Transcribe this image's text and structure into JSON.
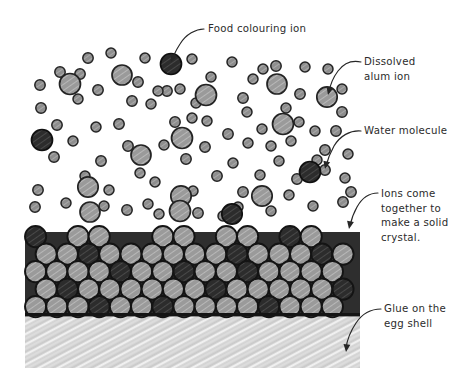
{
  "diagram": {
    "background_color": "#ffffff",
    "width": 474,
    "height": 377
  },
  "labels": [
    {
      "id": "food-colouring-ion",
      "lines": [
        "Food colouring ion"
      ],
      "text_x": 208,
      "text_y": 32,
      "anchor": "start"
    },
    {
      "id": "dissolved-alum-ion",
      "lines": [
        "Dissolved",
        "alum ion"
      ],
      "text_x": 364,
      "text_y": 65,
      "anchor": "start"
    },
    {
      "id": "water-molecule",
      "lines": [
        "Water molecule"
      ],
      "text_x": 364,
      "text_y": 134,
      "anchor": "start"
    },
    {
      "id": "ions-come-together",
      "lines": [
        "Ions come",
        "together to",
        "make a solid",
        "crystal."
      ],
      "text_x": 381,
      "text_y": 197,
      "anchor": "start"
    },
    {
      "id": "glue-on-egg-shell",
      "lines": [
        "Glue on the",
        "egg shell"
      ],
      "text_x": 384,
      "text_y": 312,
      "anchor": "start"
    }
  ],
  "leaders": [
    {
      "id": "leader-food-colouring-ion",
      "path": "M 204 29 C 196 29, 186 34, 180 44 C 176 50, 174 55, 172 59",
      "arrow": {
        "x": 171,
        "y": 62,
        "angle": 112
      }
    },
    {
      "id": "leader-dissolved-alum-ion",
      "path": "M 361 62 C 352 60, 344 63, 338 71 C 332 79, 330 86, 329 92",
      "arrow": {
        "x": 328,
        "y": 95,
        "angle": 104
      }
    },
    {
      "id": "leader-water-molecule",
      "path": "M 361 131 C 350 130, 340 136, 334 146 C 329 155, 327 162, 326 166",
      "arrow": {
        "x": 325,
        "y": 169,
        "angle": 103
      }
    },
    {
      "id": "leader-ions-come-together",
      "path": "M 378 193 C 370 193, 362 198, 357 207 C 353 214, 351 221, 350 226",
      "arrow": {
        "x": 349,
        "y": 229,
        "angle": 101
      }
    },
    {
      "id": "leader-glue-on-egg-shell",
      "path": "M 381 309 C 371 309, 362 314, 356 323 C 350 332, 347 341, 346 348",
      "arrow": {
        "x": 346,
        "y": 352,
        "angle": 97
      }
    }
  ],
  "solution": {
    "region": {
      "x": 20,
      "y": 35,
      "width": 340,
      "height": 190
    },
    "water_molecules": [
      {
        "x": 88,
        "y": 58,
        "r": 5.2
      },
      {
        "x": 111,
        "y": 53,
        "r": 5.0
      },
      {
        "x": 145,
        "y": 58,
        "r": 5.0
      },
      {
        "x": 192,
        "y": 59,
        "r": 5.0
      },
      {
        "x": 232,
        "y": 62,
        "r": 5.0
      },
      {
        "x": 276,
        "y": 66,
        "r": 5.2
      },
      {
        "x": 305,
        "y": 67,
        "r": 5.0
      },
      {
        "x": 328,
        "y": 69,
        "r": 5.0
      },
      {
        "x": 60,
        "y": 72,
        "r": 5.2
      },
      {
        "x": 80,
        "y": 74,
        "r": 5.2
      },
      {
        "x": 138,
        "y": 82,
        "r": 5.2
      },
      {
        "x": 211,
        "y": 77,
        "r": 5.0
      },
      {
        "x": 253,
        "y": 79,
        "r": 5.0
      },
      {
        "x": 300,
        "y": 94,
        "r": 5.2
      },
      {
        "x": 40,
        "y": 85,
        "r": 5.2
      },
      {
        "x": 98,
        "y": 90,
        "r": 5.2
      },
      {
        "x": 167,
        "y": 91,
        "r": 5.2
      },
      {
        "x": 180,
        "y": 89,
        "r": 5.0
      },
      {
        "x": 158,
        "y": 91,
        "r": 5.0
      },
      {
        "x": 243,
        "y": 98,
        "r": 5.2
      },
      {
        "x": 342,
        "y": 89,
        "r": 5.0
      },
      {
        "x": 263,
        "y": 69,
        "r": 5.0
      },
      {
        "x": 78,
        "y": 99,
        "r": 5.0
      },
      {
        "x": 41,
        "y": 108,
        "r": 5.2
      },
      {
        "x": 132,
        "y": 101,
        "r": 5.2
      },
      {
        "x": 151,
        "y": 104,
        "r": 5.0
      },
      {
        "x": 196,
        "y": 103,
        "r": 5.0
      },
      {
        "x": 207,
        "y": 121,
        "r": 5.0
      },
      {
        "x": 247,
        "y": 112,
        "r": 5.0
      },
      {
        "x": 286,
        "y": 108,
        "r": 5.0
      },
      {
        "x": 299,
        "y": 122,
        "r": 5.0
      },
      {
        "x": 342,
        "y": 112,
        "r": 5.2
      },
      {
        "x": 57,
        "y": 125,
        "r": 5.2
      },
      {
        "x": 96,
        "y": 127,
        "r": 5.0
      },
      {
        "x": 119,
        "y": 124,
        "r": 5.2
      },
      {
        "x": 175,
        "y": 122,
        "r": 5.2
      },
      {
        "x": 192,
        "y": 118,
        "r": 5.0
      },
      {
        "x": 228,
        "y": 134,
        "r": 5.2
      },
      {
        "x": 262,
        "y": 129,
        "r": 5.0
      },
      {
        "x": 315,
        "y": 131,
        "r": 5.0
      },
      {
        "x": 336,
        "y": 131,
        "r": 5.2
      },
      {
        "x": 73,
        "y": 141,
        "r": 5.0
      },
      {
        "x": 128,
        "y": 146,
        "r": 5.2
      },
      {
        "x": 164,
        "y": 145,
        "r": 5.0
      },
      {
        "x": 205,
        "y": 147,
        "r": 5.2
      },
      {
        "x": 248,
        "y": 143,
        "r": 5.0
      },
      {
        "x": 291,
        "y": 141,
        "r": 5.0
      },
      {
        "x": 271,
        "y": 146,
        "r": 5.0
      },
      {
        "x": 325,
        "y": 150,
        "r": 5.2
      },
      {
        "x": 348,
        "y": 154,
        "r": 5.0
      },
      {
        "x": 54,
        "y": 157,
        "r": 5.2
      },
      {
        "x": 101,
        "y": 161,
        "r": 5.2
      },
      {
        "x": 186,
        "y": 159,
        "r": 5.2
      },
      {
        "x": 233,
        "y": 163,
        "r": 5.0
      },
      {
        "x": 279,
        "y": 161,
        "r": 5.0
      },
      {
        "x": 317,
        "y": 160,
        "r": 5.0
      },
      {
        "x": 325,
        "y": 170,
        "r": 5.2
      },
      {
        "x": 85,
        "y": 176,
        "r": 5.0
      },
      {
        "x": 140,
        "y": 173,
        "r": 5.0
      },
      {
        "x": 155,
        "y": 182,
        "r": 5.0
      },
      {
        "x": 217,
        "y": 176,
        "r": 5.2
      },
      {
        "x": 260,
        "y": 175,
        "r": 5.0
      },
      {
        "x": 297,
        "y": 179,
        "r": 5.2
      },
      {
        "x": 345,
        "y": 178,
        "r": 5.0
      },
      {
        "x": 38,
        "y": 190,
        "r": 5.2
      },
      {
        "x": 109,
        "y": 190,
        "r": 5.0
      },
      {
        "x": 193,
        "y": 191,
        "r": 5.0
      },
      {
        "x": 243,
        "y": 192,
        "r": 5.2
      },
      {
        "x": 289,
        "y": 195,
        "r": 5.0
      },
      {
        "x": 351,
        "y": 192,
        "r": 5.2
      },
      {
        "x": 35,
        "y": 207,
        "r": 5.2
      },
      {
        "x": 66,
        "y": 203,
        "r": 5.0
      },
      {
        "x": 104,
        "y": 206,
        "r": 5.0
      },
      {
        "x": 127,
        "y": 210,
        "r": 5.2
      },
      {
        "x": 148,
        "y": 204,
        "r": 5.0
      },
      {
        "x": 159,
        "y": 214,
        "r": 5.0
      },
      {
        "x": 198,
        "y": 213,
        "r": 5.2
      },
      {
        "x": 238,
        "y": 207,
        "r": 5.0
      },
      {
        "x": 271,
        "y": 211,
        "r": 5.0
      },
      {
        "x": 313,
        "y": 206,
        "r": 5.0
      },
      {
        "x": 343,
        "y": 202,
        "r": 5.2
      },
      {
        "x": 223,
        "y": 216,
        "r": 5.0
      }
    ],
    "alum_ions": [
      {
        "x": 70,
        "y": 84,
        "r": 10.5
      },
      {
        "x": 122,
        "y": 75,
        "r": 10.0
      },
      {
        "x": 206,
        "y": 95,
        "r": 10.5
      },
      {
        "x": 277,
        "y": 84,
        "r": 10.0
      },
      {
        "x": 327,
        "y": 97,
        "r": 10.2
      },
      {
        "x": 283,
        "y": 124,
        "r": 10.5
      },
      {
        "x": 182,
        "y": 138,
        "r": 10.5
      },
      {
        "x": 141,
        "y": 155,
        "r": 10.0
      },
      {
        "x": 88,
        "y": 187,
        "r": 10.2
      },
      {
        "x": 181,
        "y": 196,
        "r": 10.2
      },
      {
        "x": 90,
        "y": 212,
        "r": 10.0
      },
      {
        "x": 180,
        "y": 211,
        "r": 10.5
      },
      {
        "x": 262,
        "y": 196,
        "r": 10.2
      }
    ],
    "colouring_ions": [
      {
        "x": 171,
        "y": 64,
        "r": 10.5
      },
      {
        "x": 42,
        "y": 140,
        "r": 10.5
      },
      {
        "x": 310,
        "y": 172,
        "r": 10.5
      },
      {
        "x": 232,
        "y": 214,
        "r": 10.2
      }
    ]
  },
  "crystal": {
    "region": {
      "x": 25,
      "y": 226,
      "width": 335,
      "height": 90
    },
    "circle_radius": 10.6,
    "row_spacing": 17.5,
    "rows": 5,
    "colors": {
      "light": "#8f8f8f",
      "dark": "#2e2e2e",
      "outline": "#141414"
    },
    "dark_positions": [
      [
        0,
        0
      ],
      [
        0,
        5
      ],
      [
        0,
        12
      ],
      [
        0,
        14
      ],
      [
        1,
        2
      ],
      [
        1,
        9
      ],
      [
        1,
        13
      ],
      [
        2,
        4
      ],
      [
        2,
        7
      ],
      [
        2,
        10
      ],
      [
        2,
        16
      ],
      [
        3,
        1
      ],
      [
        3,
        8
      ],
      [
        3,
        14
      ],
      [
        4,
        3
      ],
      [
        4,
        6
      ],
      [
        4,
        11
      ],
      [
        4,
        15
      ]
    ],
    "top_row_gaps": [
      1,
      4,
      5,
      8,
      11,
      14
    ]
  },
  "glue": {
    "region": {
      "x": 25,
      "y": 316,
      "width": 335,
      "height": 52
    },
    "fill_color": "#d4d4d4",
    "hatch_color": "#eeeeee"
  },
  "legend_semantics": {
    "water_molecule": "small gray circle",
    "dissolved_alum_ion": "large light gray circle",
    "food_colouring_ion": "large dark circle"
  }
}
